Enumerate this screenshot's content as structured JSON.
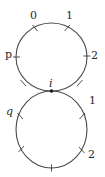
{
  "diagram": {
    "type": "two tangent loops with marked points",
    "colors": {
      "stroke": "#4a4a4a",
      "text": "#2a2a2a",
      "background": "#ffffff"
    },
    "junction": {
      "label": "i",
      "x": 51.5,
      "y": 91
    },
    "top_loop": {
      "center": [
        51.5,
        57
      ],
      "rx": 35.5,
      "ry": 34,
      "labels": [
        {
          "text": "0",
          "x": 33,
          "y": 19,
          "italic": false
        },
        {
          "text": "1",
          "x": 69,
          "y": 19,
          "italic": false
        },
        {
          "text": "p",
          "x": 9,
          "y": 57,
          "italic": false
        },
        {
          "text": "2",
          "x": 94,
          "y": 58,
          "italic": false
        }
      ]
    },
    "bottom_loop": {
      "center": [
        51.5,
        129.5
      ],
      "rx": 35.5,
      "ry": 38.5,
      "labels": [
        {
          "text": "q",
          "x": 10,
          "y": 114,
          "italic": true
        },
        {
          "text": "1",
          "x": 92,
          "y": 104,
          "italic": false
        },
        {
          "text": "2",
          "x": 91,
          "y": 157,
          "italic": false
        }
      ]
    }
  }
}
